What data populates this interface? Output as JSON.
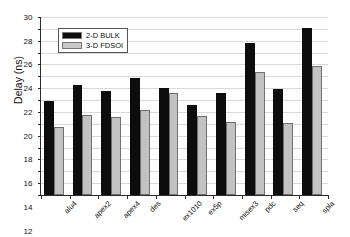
{
  "chart_data": {
    "type": "bar",
    "title": "",
    "xlabel": "",
    "ylabel": "Delay (ns)",
    "ylim": [
      0,
      30
    ],
    "ytick_step": 2,
    "yticks": [
      0,
      2,
      4,
      6,
      8,
      10,
      12,
      14,
      16,
      18,
      20,
      22,
      24,
      26,
      28,
      30
    ],
    "grid": true,
    "legend_position": "upper-left-inside",
    "categories": [
      "alu4",
      "apex2",
      "apex4",
      "des",
      "ex1010",
      "ex5p",
      "misex3",
      "pdc",
      "seq",
      "spla"
    ],
    "series": [
      {
        "name": "2-D BULK",
        "color": "#0d0d0d",
        "values": [
          15.9,
          18.5,
          17.5,
          19.7,
          18.0,
          15.1,
          17.2,
          25.6,
          17.9,
          28.1
        ]
      },
      {
        "name": "3-D FDSOI",
        "color": "#c2c2c2",
        "values": [
          11.5,
          13.5,
          13.2,
          14.3,
          17.2,
          13.4,
          12.3,
          20.7,
          12.2,
          21.8
        ]
      }
    ]
  },
  "legend": {
    "items": [
      {
        "label": "2-D BULK"
      },
      {
        "label": "3-D FDSOI"
      }
    ]
  }
}
